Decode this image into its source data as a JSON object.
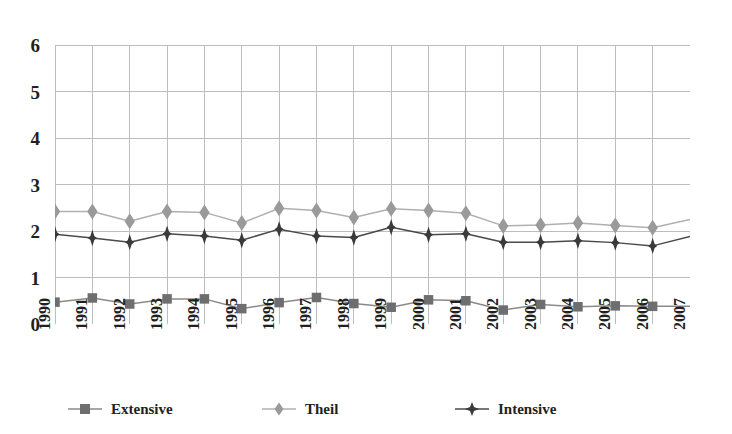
{
  "chart_data": {
    "type": "line",
    "title": "",
    "subtitle": "",
    "xlabel": "",
    "ylabel": "",
    "categories": [
      "1990",
      "1991",
      "1992",
      "1993",
      "1994",
      "1995",
      "1996",
      "1997",
      "1998",
      "1999",
      "2000",
      "2001",
      "2002",
      "2003",
      "2004",
      "2005",
      "2006",
      "2007"
    ],
    "x_tick_labels": [
      "1990",
      "1991",
      "1992",
      "1993",
      "1994",
      "1995",
      "1996",
      "1997",
      "1998",
      "1999",
      "2000",
      "2001",
      "2002",
      "2003",
      "2004",
      "2005",
      "2006",
      "2007"
    ],
    "y_tick_labels": [
      "0",
      "1",
      "2",
      "3",
      "4",
      "5",
      "6"
    ],
    "y_ticks": [
      0,
      1,
      2,
      3,
      4,
      5,
      6
    ],
    "ylim": [
      0,
      6
    ],
    "xlim_labels": [
      "1990",
      "2007"
    ],
    "grid": true,
    "grid_x": true,
    "grid_y": true,
    "legend_position": "bottom",
    "series": [
      {
        "name": "Extensive",
        "marker": "square",
        "color": "#6e6e6e",
        "line_color": "#8a8a8a",
        "values": [
          0.47,
          0.56,
          0.43,
          0.54,
          0.54,
          0.33,
          0.46,
          0.57,
          0.44,
          0.36,
          0.52,
          0.5,
          0.3,
          0.42,
          0.37,
          0.39,
          0.38,
          0.38
        ]
      },
      {
        "name": "Theil",
        "marker": "diamond",
        "color": "#9a9a9a",
        "line_color": "#b0b0b0",
        "values": [
          2.42,
          2.42,
          2.21,
          2.42,
          2.4,
          2.17,
          2.49,
          2.44,
          2.29,
          2.48,
          2.44,
          2.38,
          2.11,
          2.13,
          2.17,
          2.12,
          2.07,
          2.25
        ]
      },
      {
        "name": "Intensive",
        "marker": "plus",
        "color": "#3a3a3a",
        "line_color": "#4a4a4a",
        "values": [
          1.93,
          1.85,
          1.76,
          1.94,
          1.89,
          1.8,
          2.04,
          1.89,
          1.86,
          2.08,
          1.92,
          1.94,
          1.76,
          1.76,
          1.79,
          1.75,
          1.68,
          1.88
        ]
      }
    ],
    "legend_entries": [
      "Extensive",
      "Theil",
      "Intensive"
    ]
  },
  "colors": {
    "grid": "#bdbdbd",
    "text": "#231f20",
    "background": "#ffffff",
    "extensive": "#6e6e6e",
    "theil": "#9a9a9a",
    "intensive": "#3a3a3a"
  }
}
